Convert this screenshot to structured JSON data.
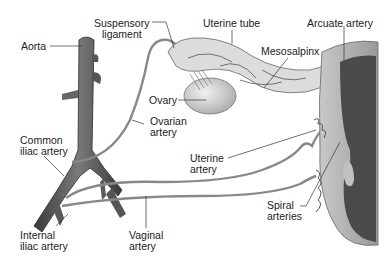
{
  "diagram": {
    "type": "anatomical-illustration",
    "labels": {
      "aorta": "Aorta",
      "suspensory_ligament_1": "Suspensory",
      "suspensory_ligament_2": "ligament",
      "uterine_tube": "Uterine tube",
      "arcuate_artery": "Arcuate artery",
      "mesosalpinx": "Mesosalpinx",
      "ovary": "Ovary",
      "ovarian_artery_1": "Ovarian",
      "ovarian_artery_2": "artery",
      "common_iliac_1": "Common",
      "common_iliac_2": "iliac artery",
      "uterine_artery_1": "Uterine",
      "uterine_artery_2": "artery",
      "spiral_arteries_1": "Spiral",
      "spiral_arteries_2": "arteries",
      "internal_iliac_1": "Internal",
      "internal_iliac_2": "iliac artery",
      "vaginal_artery_1": "Vaginal",
      "vaginal_artery_2": "artery"
    },
    "colors": {
      "vessel": "#6e6e6e",
      "vessel_dark": "#3e3e3e",
      "organ": "#d6d6d6",
      "uterus_cavity": "#4a4a4a",
      "leader_line": "#333333",
      "text": "#1c1c1c"
    }
  }
}
